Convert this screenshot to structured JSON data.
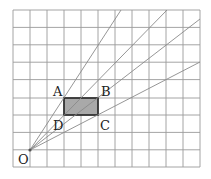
{
  "diagram": {
    "grid": {
      "columns": 11,
      "rows": 9,
      "left": 13,
      "top": 10,
      "cell_w": 17.05,
      "cell_h": 17.4,
      "line_color": "#9a9a9a"
    },
    "centre": {
      "label": "O",
      "col": 1,
      "row": 8
    },
    "rectangle": {
      "fill": "#a9a9a9",
      "vertices": [
        {
          "label": "A",
          "col": 3,
          "row": 5
        },
        {
          "label": "B",
          "col": 5,
          "row": 5
        },
        {
          "label": "C",
          "col": 5,
          "row": 6
        },
        {
          "label": "D",
          "col": 3,
          "row": 6
        }
      ]
    },
    "rays": [
      {
        "through": "A",
        "end": [
          121,
          10
        ]
      },
      {
        "through": "B",
        "end": [
          167,
          10
        ]
      },
      {
        "through": "D",
        "end": [
          200,
          19
        ]
      },
      {
        "through": "C",
        "end": [
          200,
          62
        ]
      }
    ],
    "labels": {
      "O": "O",
      "A": "A",
      "B": "B",
      "C": "C",
      "D": "D"
    }
  }
}
